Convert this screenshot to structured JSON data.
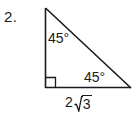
{
  "problem": {
    "number_label": "2.",
    "figure_type": "right-triangle"
  },
  "figure": {
    "angles": [
      {
        "id": "top-vertex",
        "label": "45°",
        "value": 45,
        "unit": "degrees",
        "position": "top-interior"
      },
      {
        "id": "bottom-right-vertex",
        "label": "45°",
        "value": 45,
        "unit": "degrees",
        "position": "bottom-right-interior"
      },
      {
        "id": "bottom-left-vertex",
        "label": "",
        "value": 90,
        "unit": "degrees",
        "position": "bottom-left-interior",
        "marker": "right-angle-square"
      }
    ],
    "sides": [
      {
        "id": "base",
        "label_coefficient": "2",
        "label_radicand": "3",
        "label_text": "2√3",
        "position": "below-base"
      }
    ],
    "colors": {
      "stroke": "#1a1a1a",
      "text": "#1a1a1a",
      "background": "#ffffff"
    }
  }
}
